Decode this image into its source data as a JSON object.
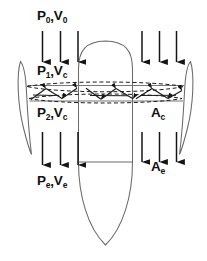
{
  "figure": {
    "width": 207,
    "height": 261,
    "background_color": "#ffffff",
    "line_color": "#555555",
    "arrow_color": "#111111",
    "text_color": "#111111"
  },
  "labels": {
    "upstream": {
      "base_p": "P",
      "sub_p": "0",
      "comma": ",",
      "base_v": "V",
      "sub_v": "0",
      "full": "P0,V0"
    },
    "disk_upper": {
      "base_p": "P",
      "sub_p": "1",
      "comma": ",",
      "base_v": "V",
      "sub_v": "c",
      "full": "P1,Vc"
    },
    "disk_lower": {
      "base_p": "P",
      "sub_p": "2",
      "comma": ",",
      "base_v": "V",
      "sub_v": "c",
      "full": "P2,Vc"
    },
    "exit": {
      "base_p": "P",
      "sub_p": "e",
      "comma": ",",
      "base_v": "V",
      "sub_v": "e",
      "full": "Pe,Ve"
    },
    "area_disk": {
      "base": "A",
      "sub": "c",
      "full": "Ac"
    },
    "area_exit": {
      "base": "A",
      "sub": "e",
      "full": "Ae"
    }
  },
  "annotations": {
    "flow_arrows_upstream_left": 3,
    "flow_arrows_upstream_right": 3,
    "flow_arrows_downstream_left": 3,
    "flow_arrows_downstream_right": 3,
    "arrow_direction": "down",
    "turbulence_band": "dashed lens with zigzag flow vectors",
    "icon_names": [
      "down-arrow-icon",
      "airfoil-blade-icon",
      "centerbody-icon",
      "dashed-flow-band-icon"
    ]
  }
}
